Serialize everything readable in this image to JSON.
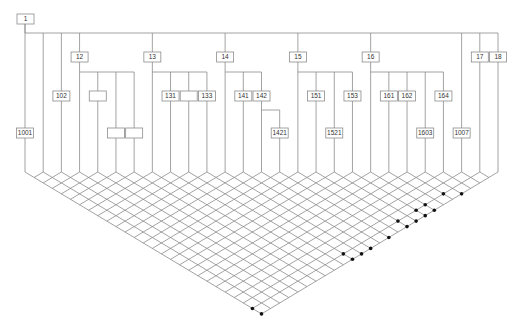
{
  "diagram": {
    "type": "tree-with-lattice",
    "colors": {
      "line": "#8c8c8c",
      "box_stroke": "#8c8c8c",
      "box_fill": "#ffffff",
      "text": "#333333",
      "dot": "#111111"
    },
    "root": {
      "label": "1",
      "x": 17,
      "y": 14,
      "w": 17,
      "h": 10,
      "column": 0
    },
    "top_bar_y": 33,
    "lattice": {
      "columns": 27,
      "x_first": 25,
      "x_last": 498,
      "top_y": 172,
      "slope": 0.6
    },
    "columns": [
      {
        "i": 0,
        "top": 24
      },
      {
        "i": 1,
        "top": 33
      },
      {
        "i": 2,
        "top": 33
      },
      {
        "i": 3,
        "top": 33
      },
      {
        "i": 4,
        "top": 72
      },
      {
        "i": 5,
        "top": 72
      },
      {
        "i": 6,
        "top": 72
      },
      {
        "i": 7,
        "top": 33
      },
      {
        "i": 8,
        "top": 72
      },
      {
        "i": 9,
        "top": 72
      },
      {
        "i": 10,
        "top": 72
      },
      {
        "i": 11,
        "top": 33
      },
      {
        "i": 12,
        "top": 72
      },
      {
        "i": 13,
        "top": 72
      },
      {
        "i": 14,
        "top": 110
      },
      {
        "i": 15,
        "top": 33
      },
      {
        "i": 16,
        "top": 72
      },
      {
        "i": 17,
        "top": 72
      },
      {
        "i": 18,
        "top": 72
      },
      {
        "i": 19,
        "top": 33
      },
      {
        "i": 20,
        "top": 72
      },
      {
        "i": 21,
        "top": 72
      },
      {
        "i": 22,
        "top": 72
      },
      {
        "i": 23,
        "top": 72
      },
      {
        "i": 24,
        "top": 33
      },
      {
        "i": 25,
        "top": 33
      },
      {
        "i": 26,
        "top": 33
      }
    ],
    "horizontal_bars": [
      {
        "y": 33,
        "from": 0,
        "to": 26
      },
      {
        "y": 72,
        "from": 3,
        "to": 6
      },
      {
        "y": 72,
        "from": 7,
        "to": 10
      },
      {
        "y": 72,
        "from": 11,
        "to": 13
      },
      {
        "y": 72,
        "from": 15,
        "to": 18
      },
      {
        "y": 72,
        "from": 19,
        "to": 23
      },
      {
        "y": 110,
        "from": 13,
        "to": 14
      }
    ],
    "nodes": [
      {
        "label": "1001",
        "column": 0,
        "y": 128
      },
      {
        "label": "102",
        "column": 2,
        "y": 91
      },
      {
        "label": "12",
        "column": 3,
        "y": 52
      },
      {
        "label": "",
        "column": 4,
        "y": 91
      },
      {
        "label": "",
        "column": 5,
        "y": 128
      },
      {
        "label": "",
        "column": 6,
        "y": 128
      },
      {
        "label": "13",
        "column": 7,
        "y": 52
      },
      {
        "label": "131",
        "column": 8,
        "y": 91
      },
      {
        "label": "",
        "column": 9,
        "y": 91
      },
      {
        "label": "133",
        "column": 10,
        "y": 91
      },
      {
        "label": "14",
        "column": 11,
        "y": 52
      },
      {
        "label": "141",
        "column": 12,
        "y": 91
      },
      {
        "label": "142",
        "column": 13,
        "y": 91
      },
      {
        "label": "1421",
        "column": 14,
        "y": 128
      },
      {
        "label": "15",
        "column": 15,
        "y": 52
      },
      {
        "label": "151",
        "column": 16,
        "y": 91
      },
      {
        "label": "1521",
        "column": 17,
        "y": 128
      },
      {
        "label": "153",
        "column": 18,
        "y": 91
      },
      {
        "label": "16",
        "column": 19,
        "y": 52
      },
      {
        "label": "161",
        "column": 20,
        "y": 91
      },
      {
        "label": "162",
        "column": 21,
        "y": 91
      },
      {
        "label": "1603",
        "column": 22,
        "y": 128
      },
      {
        "label": "164",
        "column": 23,
        "y": 91
      },
      {
        "label": "1007",
        "column": 24,
        "y": 128
      },
      {
        "label": "17",
        "column": 25,
        "y": 52
      },
      {
        "label": "18",
        "column": 26,
        "y": 52
      }
    ],
    "dots": [
      [
        21,
        25
      ],
      [
        22,
        26
      ],
      [
        19,
        25
      ],
      [
        18,
        25
      ],
      [
        19,
        26
      ],
      [
        18,
        26
      ],
      [
        16,
        25
      ],
      [
        17,
        26
      ],
      [
        16,
        26
      ],
      [
        14,
        26
      ],
      [
        12,
        26
      ],
      [
        11,
        26
      ],
      [
        10,
        25
      ],
      [
        10,
        26
      ],
      [
        0,
        25
      ],
      [
        0,
        26
      ]
    ]
  }
}
